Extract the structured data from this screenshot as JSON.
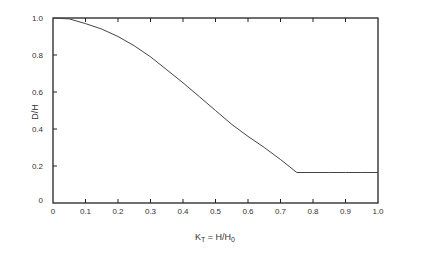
{
  "chart_data": {
    "type": "line",
    "title": "",
    "xlabel": "K_T = H/H_0",
    "xlabel_parts": {
      "main": "K",
      "sub": "T",
      "mid": " = H/H",
      "sub2": "0"
    },
    "ylabel": "D/H",
    "xlim": [
      0,
      1.0
    ],
    "ylim": [
      0,
      1.0
    ],
    "grid": false,
    "legend": null,
    "x_ticks": [
      "0",
      "0.1",
      "0.2",
      "0.3",
      "0.4",
      "0.5",
      "0.6",
      "0.7",
      "0.8",
      "0.9",
      "1.0"
    ],
    "y_ticks": [
      "0",
      "0.2",
      "0.4",
      "0.6",
      "0.8",
      "1.0"
    ],
    "series": [
      {
        "name": "D/H vs K_T",
        "x": [
          0,
          0.05,
          0.1,
          0.15,
          0.2,
          0.25,
          0.3,
          0.35,
          0.4,
          0.45,
          0.5,
          0.55,
          0.6,
          0.65,
          0.7,
          0.75,
          0.8,
          0.85,
          0.9,
          0.95,
          1.0
        ],
        "y": [
          1.0,
          0.995,
          0.97,
          0.94,
          0.9,
          0.85,
          0.79,
          0.72,
          0.65,
          0.575,
          0.5,
          0.425,
          0.36,
          0.3,
          0.235,
          0.165,
          0.165,
          0.165,
          0.165,
          0.165,
          0.165
        ]
      }
    ]
  }
}
